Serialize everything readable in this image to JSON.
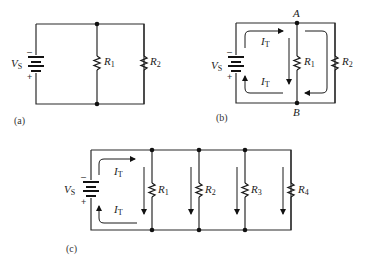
{
  "panels": {
    "a": {
      "caption": "(a)",
      "source": {
        "label": "V",
        "sub": "S",
        "minus": "–",
        "plus": "+"
      },
      "resistors": [
        {
          "label": "R",
          "sub": "1"
        },
        {
          "label": "R",
          "sub": "2"
        }
      ]
    },
    "b": {
      "caption": "(b)",
      "node_top": "A",
      "node_bottom": "B",
      "source": {
        "label": "V",
        "sub": "S",
        "minus": "–",
        "plus": "+"
      },
      "currents": [
        {
          "label": "I",
          "sub": "T"
        },
        {
          "label": "I",
          "sub": "T"
        }
      ],
      "resistors": [
        {
          "label": "R",
          "sub": "1"
        },
        {
          "label": "R",
          "sub": "2"
        }
      ]
    },
    "c": {
      "caption": "(c)",
      "source": {
        "label": "V",
        "sub": "S",
        "minus": "–",
        "plus": "+"
      },
      "currents": [
        {
          "label": "I",
          "sub": "T"
        },
        {
          "label": "I",
          "sub": "T"
        }
      ],
      "resistors": [
        {
          "label": "R",
          "sub": "1"
        },
        {
          "label": "R",
          "sub": "2"
        },
        {
          "label": "R",
          "sub": "3"
        },
        {
          "label": "R",
          "sub": "4"
        }
      ]
    }
  },
  "colors": {
    "ink": "#1a1a1a",
    "background": "#ffffff"
  }
}
